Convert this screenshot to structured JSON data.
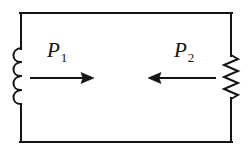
{
  "figure": {
    "kind": "circuit-diagram",
    "background_color": "#ffffff",
    "line_color": "#141414",
    "line_width": 2
  },
  "loop": {
    "name": "circuit-loop",
    "left_x": 21,
    "right_x": 231,
    "top_y": 13,
    "bottom_y": 142
  },
  "components": [
    {
      "id": "inductor",
      "type": "inductor",
      "icon": "inductor-coil-icon",
      "side": "left",
      "x": 21,
      "top_y": 48,
      "bottom_y": 105,
      "loops": 4,
      "bulge_direction": "left",
      "bulge_radius": 8
    },
    {
      "id": "resistor",
      "type": "resistor",
      "icon": "resistor-zigzag-icon",
      "side": "right",
      "x": 231,
      "top_y": 55,
      "bottom_y": 99,
      "zigzag_segments": 7,
      "amplitude": 7
    }
  ],
  "arrows": [
    {
      "id": "arrow-p1",
      "icon": "arrow-right-icon",
      "direction": "right",
      "tail_x": 30,
      "tip_x": 94,
      "y": 78,
      "label_id": "p1"
    },
    {
      "id": "arrow-p2",
      "icon": "arrow-left-icon",
      "direction": "left",
      "tail_x": 216,
      "tip_x": 148,
      "y": 78,
      "label_id": "p2"
    }
  ],
  "labels": {
    "p1": {
      "base": "P",
      "subscript": "1"
    },
    "p2": {
      "base": "P",
      "subscript": "2"
    }
  }
}
